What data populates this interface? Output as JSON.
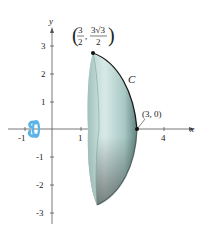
{
  "figure": {
    "type": "solid-of-revolution",
    "axes": {
      "x_label": "x",
      "y_label": "y",
      "x_ticks": [
        "-1",
        "1",
        "4"
      ],
      "y_ticks": [
        "3",
        "2",
        "1",
        "-1",
        "-2",
        "-3"
      ]
    },
    "curve_label": "C",
    "points": {
      "top": {
        "label_num_x": "3",
        "label_den_x": "2",
        "label_num_y": "3√3",
        "label_den_y": "2",
        "coords": "(3/2, 3√3/2)"
      },
      "right": {
        "label": "(3, 0)"
      }
    },
    "rotation_icon": "rotation-arrow-about-x-axis",
    "colors": {
      "solid_light": "#cfe3e0",
      "solid_mid": "#9fc3bf",
      "solid_dark": "#3f5a57",
      "rotation_arrow": "#5ab4e6",
      "axis": "#555555",
      "curve": "#1a1a1a"
    }
  }
}
